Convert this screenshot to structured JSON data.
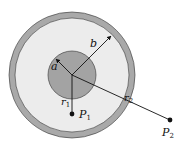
{
  "diagram": {
    "labels": {
      "inner_radius": "a",
      "outer_radius": "b",
      "r1": "r",
      "r1_sub": "1",
      "r2": "r",
      "r2_sub": "2",
      "p1": "P",
      "p1_sub": "1",
      "p2": "P",
      "p2_sub": "2"
    },
    "colors": {
      "background": "#ffffff",
      "outer_shell": "#a9a9a9",
      "gap_region": "#ececec",
      "inner_cylinder": "#a3a3a3",
      "lines": "#111111"
    }
  }
}
